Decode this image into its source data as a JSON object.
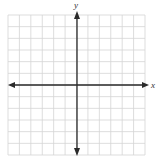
{
  "figure": {
    "type": "coordinate-plane",
    "x_axis_label": "x",
    "y_axis_label": "y",
    "grid": {
      "columns": 12,
      "rows": 12,
      "line_color": "#d4d4d4"
    },
    "axis_color": "#2a2a2a",
    "arrows": "both-ends"
  }
}
